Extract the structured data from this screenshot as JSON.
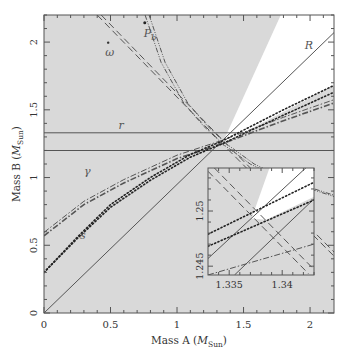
{
  "chart_data": {
    "type": "line",
    "title": "",
    "xlabel": "Mass A (M_Sun)",
    "ylabel": "Mass B (M_Sun)",
    "xlabel_main": "Mass A (",
    "xlabel_sym": "M",
    "xlabel_sub": "Sun",
    "xlabel_close": ")",
    "ylabel_main": "Mass B (",
    "ylabel_sym": "M",
    "ylabel_sub": "Sun",
    "ylabel_close": ")",
    "xlim": [
      0,
      2.18
    ],
    "ylim": [
      0,
      2.2
    ],
    "xticks": [
      0,
      0.5,
      1,
      1.5,
      2
    ],
    "xtick_labels": [
      "0",
      "0.5",
      "1",
      "1.5",
      "2"
    ],
    "yticks": [
      0,
      0.5,
      1,
      1.5,
      2
    ],
    "ytick_labels": [
      "0",
      "0.5",
      "1",
      "1.5",
      "2"
    ],
    "grid": false,
    "legend": "none (curves labelled inline)",
    "shading": {
      "excluded_region_color": "#d9d9d9",
      "allowed_region_color": "#ffffff",
      "allowed_wedge": [
        [
          1.34,
          1.25
        ],
        [
          1.78,
          2.2
        ],
        [
          2.18,
          2.2
        ],
        [
          2.18,
          1.68
        ]
      ]
    },
    "series": [
      {
        "name": "R",
        "style": "solid",
        "label_pos": [
          1.96,
          1.95
        ],
        "points": [
          [
            0,
            0
          ],
          [
            2.18,
            2.07
          ]
        ]
      },
      {
        "name": "r",
        "style": "solid",
        "label_pos": [
          0.56,
          1.36
        ],
        "points_upper": [
          [
            0,
            1.33
          ],
          [
            2.18,
            1.33
          ]
        ],
        "points_lower": [
          [
            0,
            1.2
          ],
          [
            2.18,
            1.2
          ]
        ]
      },
      {
        "name": "ω",
        "style": "dashed",
        "label_pos": [
          0.46,
          1.9
        ],
        "points_a": [
          [
            0.4,
            2.2
          ],
          [
            1.34,
            1.25
          ],
          [
            2.18,
            0.42
          ]
        ],
        "points_b": [
          [
            0.43,
            2.2
          ],
          [
            1.37,
            1.25
          ],
          [
            2.18,
            0.45
          ]
        ]
      },
      {
        "name": "P_b",
        "style": "dash-dot-dot",
        "label_pos": [
          0.75,
          2.04
        ],
        "points": [
          [
            0.76,
            2.2
          ],
          [
            0.88,
            1.85
          ],
          [
            1.05,
            1.55
          ],
          [
            1.2,
            1.38
          ],
          [
            1.34,
            1.25
          ],
          [
            1.55,
            1.1
          ],
          [
            1.8,
            0.98
          ],
          [
            2.18,
            0.86
          ]
        ]
      },
      {
        "name": "γ",
        "style": "dash-dot",
        "label_pos": [
          0.3,
          1.02
        ],
        "points": [
          [
            0,
            0.57
          ],
          [
            0.3,
            0.8
          ],
          [
            0.6,
            0.96
          ],
          [
            1.0,
            1.14
          ],
          [
            1.34,
            1.25
          ],
          [
            1.8,
            1.42
          ],
          [
            2.18,
            1.55
          ]
        ]
      },
      {
        "name": "s",
        "style": "dotted",
        "label_pos": [
          0.27,
          0.55
        ],
        "points_a": [
          [
            0,
            0.3
          ],
          [
            0.25,
            0.55
          ],
          [
            0.5,
            0.78
          ],
          [
            0.8,
            0.98
          ],
          [
            1.1,
            1.15
          ],
          [
            1.34,
            1.25
          ],
          [
            1.8,
            1.46
          ],
          [
            2.18,
            1.63
          ]
        ],
        "points_b": [
          [
            0,
            0.3
          ],
          [
            0.25,
            0.56
          ],
          [
            0.5,
            0.8
          ],
          [
            0.8,
            1.0
          ],
          [
            1.1,
            1.17
          ],
          [
            1.34,
            1.27
          ],
          [
            1.8,
            1.5
          ],
          [
            2.18,
            1.68
          ]
        ]
      }
    ],
    "annotations": [
      "R",
      "r",
      "ω",
      "P_b",
      "γ",
      "s"
    ],
    "inset": {
      "xlim": [
        1.333,
        1.343
      ],
      "ylim": [
        1.2442,
        1.2539
      ],
      "xticks": [
        1.335,
        1.34
      ],
      "xtick_labels": [
        "1.335",
        "1.34"
      ],
      "yticks": [
        1.245,
        1.25
      ],
      "ytick_labels": [
        "1.245",
        "1.25"
      ],
      "lines": {
        "R_a": [
          [
            1.333,
            1.2457
          ],
          [
            1.343,
            1.2546
          ]
        ],
        "R_b": [
          [
            1.3355,
            1.2442
          ],
          [
            1.343,
            1.2511
          ]
        ],
        "s_a": [
          [
            1.333,
            1.2468
          ],
          [
            1.343,
            1.251
          ]
        ],
        "s_b": [
          [
            1.333,
            1.2479
          ],
          [
            1.343,
            1.2526
          ]
        ],
        "gamma": [
          [
            1.333,
            1.2442
          ],
          [
            1.343,
            1.247
          ]
        ],
        "omega_a": [
          [
            1.333,
            1.2536
          ],
          [
            1.3425,
            1.2443
          ]
        ],
        "omega_b": [
          [
            1.3336,
            1.2539
          ],
          [
            1.343,
            1.2447
          ]
        ]
      },
      "white_wedge": [
        [
          1.3371,
          1.2493
        ],
        [
          1.3388,
          1.2539
        ],
        [
          1.343,
          1.2539
        ],
        [
          1.343,
          1.2513
        ],
        [
          1.3385,
          1.2492
        ]
      ]
    }
  }
}
